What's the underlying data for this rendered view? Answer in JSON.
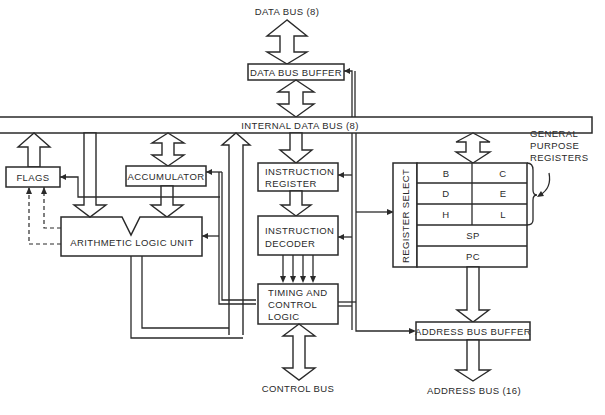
{
  "diagram": {
    "type": "block-diagram",
    "external_labels": {
      "data_bus": "DATA BUS (8)",
      "control_bus": "CONTROL BUS",
      "address_bus": "ADDRESS BUS (16)"
    },
    "blocks": {
      "data_bus_buffer": "DATA BUS BUFFER",
      "internal_data_bus": "INTERNAL DATA BUS (8)",
      "flags": "FLAGS",
      "accumulator": "ACCUMULATOR",
      "alu": "ARITHMETIC LOGIC UNIT",
      "instruction_register_line1": "INSTRUCTION",
      "instruction_register_line2": "REGISTER",
      "instruction_decoder_line1": "INSTRUCTION",
      "instruction_decoder_line2": "DECODER",
      "timing_line1": "TIMING AND",
      "timing_line2": "CONTROL",
      "timing_line3": "LOGIC",
      "register_select": "REGISTER SELECT",
      "address_bus_buffer": "ADDRESS BUS BUFFER"
    },
    "registers": {
      "pairs": [
        {
          "left": "B",
          "right": "C"
        },
        {
          "left": "D",
          "right": "E"
        },
        {
          "left": "H",
          "right": "L"
        }
      ],
      "sp": "SP",
      "pc": "PC"
    },
    "annotation": {
      "line1": "GENERAL",
      "line2": "PURPOSE",
      "line3": "REGISTERS"
    }
  }
}
